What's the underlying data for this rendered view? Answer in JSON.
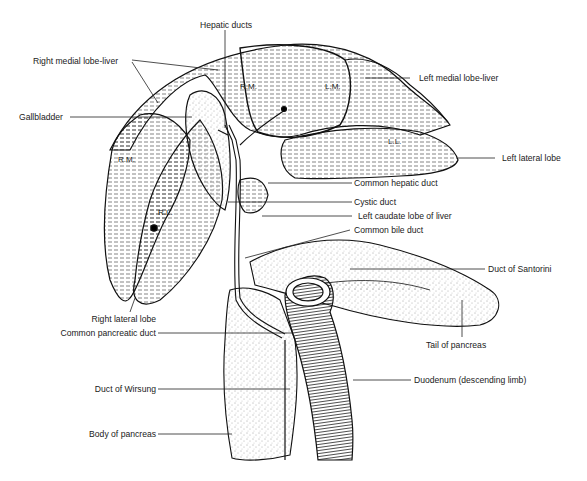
{
  "diagram": {
    "style": "black ink line illustration on white",
    "labels": [
      {
        "id": "hepatic_ducts",
        "text": "Hepatic ducts"
      },
      {
        "id": "right_medial_lobe_liver",
        "text": "Right medial lobe-liver"
      },
      {
        "id": "gallbladder",
        "text": "Gallbladder"
      },
      {
        "id": "left_medial_lobe_liver",
        "text": "Left medial lobe-liver"
      },
      {
        "id": "left_lateral_lobe",
        "text": "Left lateral lobe"
      },
      {
        "id": "common_hepatic_duct",
        "text": "Common hepatic duct"
      },
      {
        "id": "cystic_duct",
        "text": "Cystic duct"
      },
      {
        "id": "left_caudate_lobe",
        "text": "Left caudate lobe of liver"
      },
      {
        "id": "common_bile_duct",
        "text": "Common bile duct"
      },
      {
        "id": "duct_of_santorini",
        "text": "Duct of Santorini"
      },
      {
        "id": "right_lateral_lobe",
        "text": "Right lateral lobe"
      },
      {
        "id": "common_pancreatic_duct",
        "text": "Common pancreatic duct"
      },
      {
        "id": "tail_of_pancreas",
        "text": "Tail of pancreas"
      },
      {
        "id": "duct_of_wirsung",
        "text": "Duct of Wirsung"
      },
      {
        "id": "duodenum",
        "text": "Duodenum (descending limb)"
      },
      {
        "id": "body_of_pancreas",
        "text": "Body of pancreas"
      }
    ],
    "lobe_abbreviations": [
      {
        "id": "rm_upper",
        "text": "R.M."
      },
      {
        "id": "lm",
        "text": "L.M."
      },
      {
        "id": "ll",
        "text": "L.L."
      },
      {
        "id": "rm_left",
        "text": "R.M."
      },
      {
        "id": "rl",
        "text": "R.L."
      }
    ]
  }
}
